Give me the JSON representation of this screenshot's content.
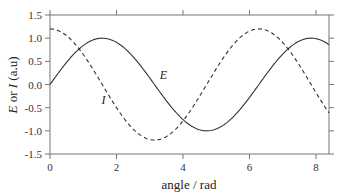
{
  "chart_data": {
    "type": "line",
    "title": "",
    "xlabel": "angle / rad",
    "ylabel": {
      "parts": [
        "E",
        " or ",
        "I",
        " (a.u)"
      ]
    },
    "xlim": [
      0,
      8.4
    ],
    "ylim": [
      -1.5,
      1.5
    ],
    "xticks": [
      0,
      2,
      4,
      6,
      8
    ],
    "xtick_labels": [
      "0",
      "2",
      "4",
      "6",
      "8"
    ],
    "yticks": [
      -1.5,
      -1.0,
      -0.5,
      0.0,
      0.5,
      1.0,
      1.5
    ],
    "ytick_labels": [
      "-1.5",
      "-1.0",
      "-0.5",
      "0.0",
      "0.5",
      "1.0",
      "1.5"
    ],
    "grid": false,
    "legend": "none (inline labels)",
    "series": [
      {
        "name": "E",
        "function": "sin(x)",
        "amplitude": 1.0,
        "style": "solid",
        "color": "#333333",
        "label_pos": [
          3.3,
          0.12
        ]
      },
      {
        "name": "I",
        "function": "1.2*cos(x)",
        "amplitude": 1.2,
        "style": "dashed",
        "color": "#333333",
        "label_pos": [
          1.55,
          -0.42
        ]
      }
    ]
  },
  "axes": {
    "frame_color": "#777777"
  }
}
